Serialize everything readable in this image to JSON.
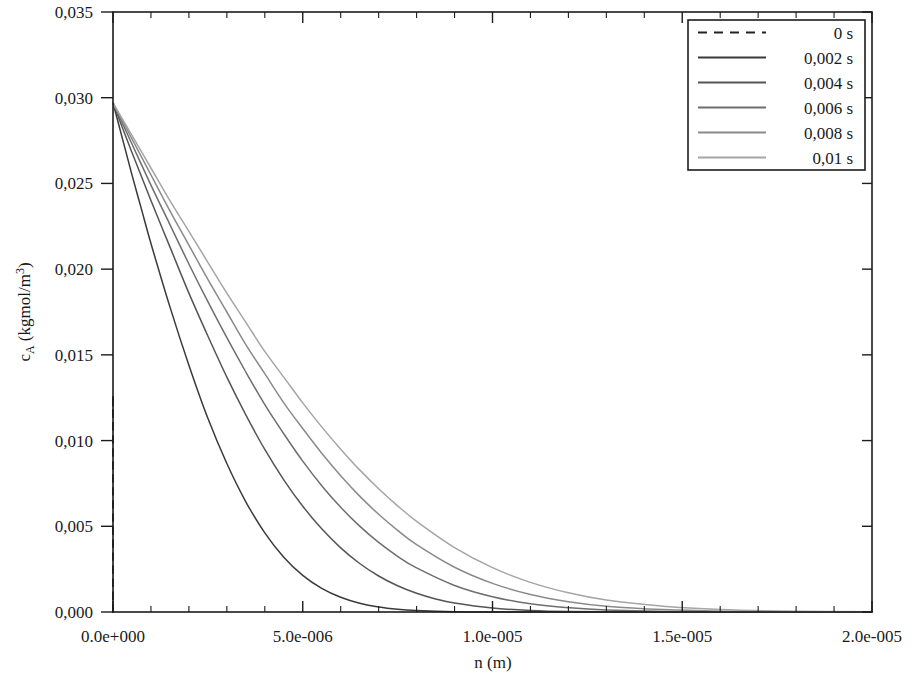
{
  "chart_data": {
    "type": "line",
    "title": "",
    "xlabel": "n (m)",
    "ylabel": "c_A (kgmol/m³)",
    "ylabel_parts": {
      "base": "c",
      "subscript": "A",
      "rest": " (kgmol/m",
      "superscript": "3",
      "tail": ")"
    },
    "xlim": [
      0,
      2e-05
    ],
    "ylim": [
      0,
      0.035
    ],
    "grid": false,
    "decimal_separator_y": ",",
    "decimal_separator_x": ".",
    "xticks": [
      0,
      5e-06,
      1e-05,
      1.5e-05,
      2e-05
    ],
    "xtick_labels": [
      "0.0e+000",
      "5.0e-006",
      "1.0e-005",
      "1.5e-005",
      "2.0e-005"
    ],
    "x_minor_ticks_per_interval": 5,
    "yticks": [
      0,
      0.005,
      0.01,
      0.015,
      0.02,
      0.025,
      0.03,
      0.035
    ],
    "ytick_labels": [
      "0,000",
      "0,005",
      "0,010",
      "0,015",
      "0,020",
      "0,025",
      "0,030",
      "0,035"
    ],
    "legend": {
      "position": "top-right",
      "entries": [
        {
          "label": "0 s",
          "style": "dashed",
          "color": "#222222"
        },
        {
          "label": "0,002 s",
          "style": "solid",
          "color": "#3a3a3a"
        },
        {
          "label": "0,004 s",
          "style": "solid",
          "color": "#555555"
        },
        {
          "label": "0,006 s",
          "style": "solid",
          "color": "#6e6e6e"
        },
        {
          "label": "0,008 s",
          "style": "solid",
          "color": "#8a8a8a"
        },
        {
          "label": "0,01 s",
          "style": "solid",
          "color": "#a5a5a5"
        }
      ]
    },
    "surface_concentration": 0.0297,
    "series": [
      {
        "name": "0 s",
        "style": "dashed",
        "color": "#222222",
        "x": [
          0,
          0,
          1e-10
        ],
        "y": [
          0,
          0.0118,
          0.0118
        ],
        "note": "initial condition: vertical dashed line at n = 0 rising to ~0.0118"
      },
      {
        "name": "0,002 s",
        "style": "solid",
        "color": "#3a3a3a",
        "x": [
          0,
          2.5e-07,
          5e-07,
          7.5e-07,
          1e-06,
          1.5e-06,
          2e-06,
          2.5e-06,
          3e-06,
          3.5e-06,
          4e-06,
          4.5e-06,
          5e-06,
          5.5e-06,
          6e-06,
          6.5e-06,
          7e-06,
          7.5e-06,
          8e-06,
          9e-06,
          1e-05,
          1.2e-05,
          1.5e-05,
          2e-05
        ],
        "y": [
          0.0297,
          0.0276,
          0.0255,
          0.0235,
          0.0215,
          0.0178,
          0.0144,
          0.0113,
          0.00866,
          0.00643,
          0.00462,
          0.0032,
          0.00214,
          0.00138,
          0.00086,
          0.00051,
          0.00029,
          0.00016,
          9e-05,
          2e-05,
          5e-06,
          2e-07,
          0.0,
          0.0
        ]
      },
      {
        "name": "0,004 s",
        "style": "solid",
        "color": "#555555",
        "x": [
          0,
          5e-07,
          1e-06,
          1.5e-06,
          2e-06,
          2.5e-06,
          3e-06,
          3.5e-06,
          4e-06,
          4.5e-06,
          5e-06,
          5.5e-06,
          6e-06,
          6.5e-06,
          7e-06,
          7.5e-06,
          8e-06,
          8.5e-06,
          9e-06,
          1e-05,
          1.1e-05,
          1.2e-05,
          1.4e-05,
          1.7e-05,
          2e-05
        ],
        "y": [
          0.0297,
          0.0268,
          0.024,
          0.0213,
          0.0186,
          0.0161,
          0.0137,
          0.0115,
          0.00948,
          0.00771,
          0.00617,
          0.00485,
          0.00374,
          0.00283,
          0.0021,
          0.00153,
          0.00109,
          0.00076,
          0.00052,
          0.00023,
          9e-05,
          3e-05,
          4e-06,
          0.0,
          0.0
        ]
      },
      {
        "name": "0,006 s",
        "style": "solid",
        "color": "#6e6e6e",
        "x": [
          0,
          5e-07,
          1e-06,
          1.5e-06,
          2e-06,
          2.5e-06,
          3e-06,
          3.5e-06,
          4e-06,
          4.5e-06,
          5e-06,
          5.5e-06,
          6e-06,
          6.5e-06,
          7e-06,
          7.5e-06,
          8e-06,
          9e-06,
          1e-05,
          1.1e-05,
          1.2e-05,
          1.3e-05,
          1.5e-05,
          1.8e-05,
          2e-05
        ],
        "y": [
          0.0297,
          0.0273,
          0.0249,
          0.0226,
          0.0203,
          0.0181,
          0.016,
          0.014,
          0.0121,
          0.0104,
          0.0088,
          0.00737,
          0.00611,
          0.00501,
          0.00406,
          0.00325,
          0.00257,
          0.00155,
          0.00089,
          0.00048,
          0.00025,
          0.00012,
          2e-05,
          1e-06,
          0.0
        ]
      },
      {
        "name": "0,008 s",
        "style": "solid",
        "color": "#8a8a8a",
        "x": [
          0,
          5e-07,
          1e-06,
          1.5e-06,
          2e-06,
          2.5e-06,
          3e-06,
          3.5e-06,
          4e-06,
          4.5e-06,
          5e-06,
          5.5e-06,
          6e-06,
          6.5e-06,
          7e-06,
          7.5e-06,
          8e-06,
          9e-06,
          1e-05,
          1.1e-05,
          1.2e-05,
          1.3e-05,
          1.45e-05,
          1.6e-05,
          1.8e-05,
          2e-05
        ],
        "y": [
          0.0297,
          0.0276,
          0.0255,
          0.0234,
          0.0214,
          0.0194,
          0.0175,
          0.0156,
          0.0139,
          0.0122,
          0.0107,
          0.00926,
          0.00795,
          0.00676,
          0.0057,
          0.00476,
          0.00393,
          0.00261,
          0.00167,
          0.00102,
          0.0006,
          0.00034,
          0.00014,
          5e-05,
          1e-05,
          2e-06
        ]
      },
      {
        "name": "0,01 s",
        "style": "solid",
        "color": "#a5a5a5",
        "x": [
          0,
          5e-07,
          1e-06,
          1.5e-06,
          2e-06,
          2.5e-06,
          3e-06,
          3.5e-06,
          4e-06,
          4.5e-06,
          5e-06,
          5.5e-06,
          6e-06,
          6.5e-06,
          7e-06,
          7.5e-06,
          8e-06,
          9e-06,
          1e-05,
          1.1e-05,
          1.2e-05,
          1.3e-05,
          1.45e-05,
          1.6e-05,
          1.8e-05,
          2e-05
        ],
        "y": [
          0.0297,
          0.0278,
          0.0259,
          0.024,
          0.0222,
          0.0204,
          0.0186,
          0.0169,
          0.0152,
          0.0137,
          0.0122,
          0.0108,
          0.0095,
          0.00829,
          0.00719,
          0.00619,
          0.00529,
          0.00376,
          0.00259,
          0.00173,
          0.00112,
          0.0007,
          0.00034,
          0.00015,
          4e-05,
          1e-05
        ]
      }
    ]
  },
  "plot_geometry": {
    "left": 113,
    "right": 872,
    "top": 12,
    "bottom": 612
  },
  "legend_geometry": {
    "left": 688,
    "top": 20,
    "width": 177,
    "height": 150
  }
}
